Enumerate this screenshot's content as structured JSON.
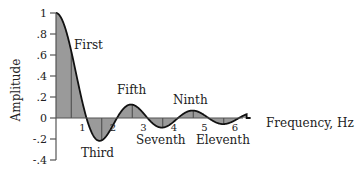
{
  "chart_data": {
    "type": "area",
    "title": "",
    "xlabel": "Frequency, Hz",
    "ylabel": "Amplitude",
    "xlim": [
      0,
      7
    ],
    "ylim": [
      -0.4,
      1.0
    ],
    "grid": false,
    "legend": null,
    "x_ticks": [
      "1",
      "2",
      "3",
      "4",
      "5",
      "6"
    ],
    "y_ticks": [
      "1",
      ".8",
      ".6",
      ".4",
      ".2",
      "0",
      "-.2",
      "-.4"
    ],
    "y_tick_values": [
      1,
      0.8,
      0.6,
      0.4,
      0.2,
      0,
      -0.2,
      -0.4
    ],
    "function": "sinc: sin(pi*x)/(pi*x), shaded area between curve and zero",
    "lobes": [
      {
        "name": "First",
        "x": 0.0,
        "peak": 1.0
      },
      {
        "name": "Third",
        "x": 1.43,
        "peak": -0.217
      },
      {
        "name": "Fifth",
        "x": 2.46,
        "peak": 0.128
      },
      {
        "name": "Seventh",
        "x": 3.47,
        "peak": -0.091
      },
      {
        "name": "Ninth",
        "x": 4.48,
        "peak": 0.071
      },
      {
        "name": "Eleventh",
        "x": 5.48,
        "peak": -0.058
      }
    ],
    "annotations": [
      "First",
      "Third",
      "Fifth",
      "Seventh",
      "Ninth",
      "Eleventh"
    ],
    "colors": {
      "fill": "#9a9a9a",
      "line": "#111111",
      "axis": "#555555"
    }
  }
}
